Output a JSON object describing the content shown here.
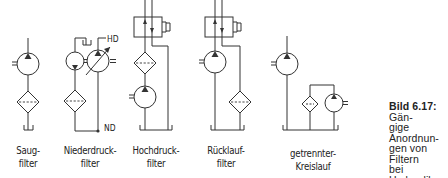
{
  "figure": {
    "caption_bold": "Bild 6.17:",
    "caption_lines": [
      "Gän-",
      "gige Anordnun-",
      "gen von Filtern",
      "bei Hydraulik-",
      "kreisläufen"
    ],
    "caption_text": "Gängige Anordnungen von Filtern bei Hydraulikkreisläufen"
  },
  "circuits": [
    {
      "id": "saugfilter",
      "label_line1": "Saug-",
      "label_line2": "filter"
    },
    {
      "id": "niederdruckfilter",
      "label_line1": "Niederdruck-",
      "label_line2": "filter",
      "tags": {
        "high_pressure": "HD",
        "low_pressure": "ND"
      }
    },
    {
      "id": "hochdruckfilter",
      "label_line1": "Hochdruck-",
      "label_line2": "filter"
    },
    {
      "id": "ruecklauffilter",
      "label_line1": "Rücklauf-",
      "label_line2": "filter"
    },
    {
      "id": "getrennter-kreislauf",
      "label_line1": "getrennter-",
      "label_line2": "Kreislauf"
    }
  ],
  "colors": {
    "line": "#333333",
    "background": "#ffffff"
  }
}
